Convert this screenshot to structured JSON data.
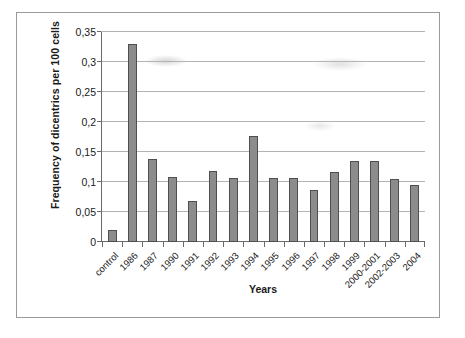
{
  "chart_data": {
    "type": "bar",
    "title": "",
    "xlabel": "Years",
    "ylabel": "Frequency of dicentrics per 100 cells",
    "categories": [
      "control",
      "1986",
      "1987",
      "1990",
      "1991",
      "1992",
      "1993",
      "1994",
      "1995",
      "1996",
      "1997",
      "1998",
      "1999",
      "2000-2001",
      "2002-2003",
      "2004"
    ],
    "values": [
      0.02,
      0.33,
      0.139,
      0.108,
      0.068,
      0.118,
      0.107,
      0.177,
      0.106,
      0.106,
      0.086,
      0.116,
      0.135,
      0.135,
      0.105,
      0.095
    ],
    "ylim": [
      0,
      0.35
    ],
    "ytick_values": [
      0,
      0.05,
      0.1,
      0.15,
      0.2,
      0.25,
      0.3,
      0.35
    ],
    "ytick_labels": [
      "0",
      "0,05",
      "0,1",
      "0,15",
      "0,2",
      "0,25",
      "0,3",
      "0,35"
    ],
    "grid": true,
    "legend": false,
    "legend_position": "none",
    "bar_color": "#8c8c8c",
    "bar_edge_color": "#4f4f4f",
    "grid_color": "#b3b3b3",
    "axis_color": "#6a6a6a"
  }
}
